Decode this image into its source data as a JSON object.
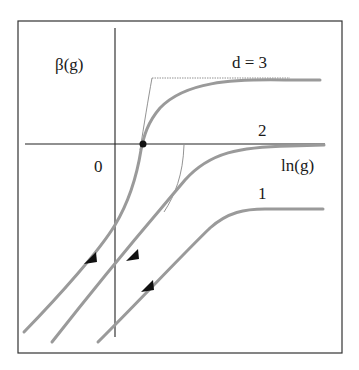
{
  "diagram": {
    "y_axis_label": "β(g)",
    "x_axis_label": "ln(g)",
    "origin_label": "0",
    "curves": [
      {
        "id": "d3",
        "label": "d = 3"
      },
      {
        "id": "d2",
        "label": "2"
      },
      {
        "id": "d1",
        "label": "1"
      }
    ],
    "fixed_point": "unstable fixed point where d=3 curve crosses β=0",
    "colors": {
      "curve": "#9a9a9a",
      "axis": "#222222",
      "frame": "#333333",
      "asymptote": "#777777",
      "arrow": "#111111"
    }
  }
}
